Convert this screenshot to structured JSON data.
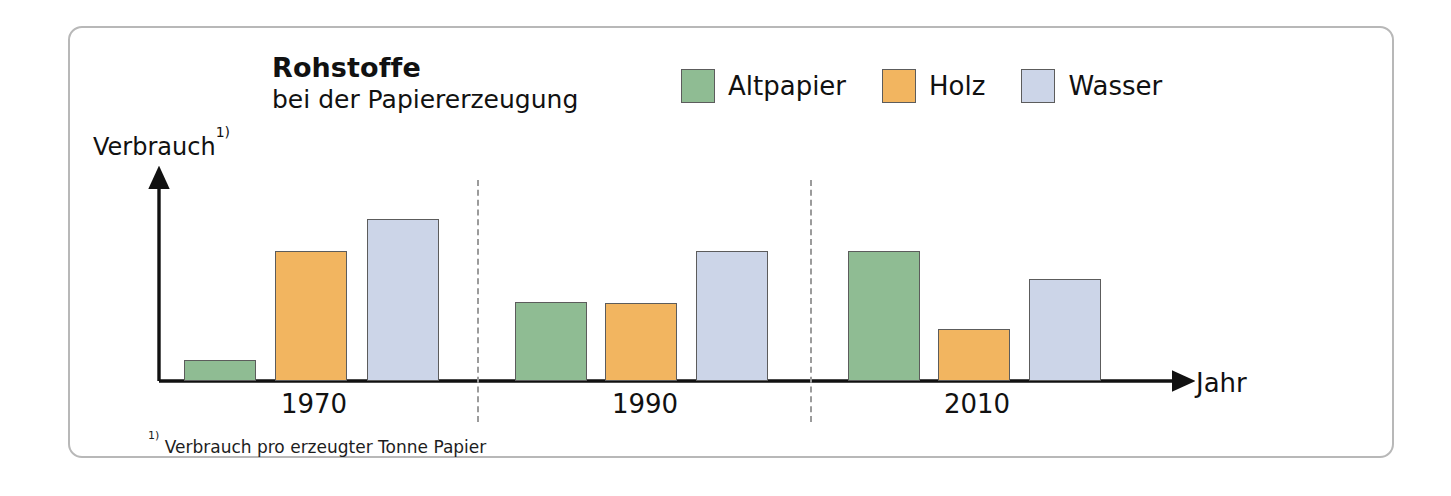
{
  "card": {
    "border_color": "#b8b8b8"
  },
  "header": {
    "title": "Rohstoffe",
    "subtitle": "bei der Papiererzeugung"
  },
  "legend": {
    "items": [
      {
        "label": "Altpapier",
        "color": "#8fbc93",
        "swatch_name": "legend-swatch-altpapier"
      },
      {
        "label": "Holz",
        "color": "#f2b560",
        "swatch_name": "legend-swatch-holz"
      },
      {
        "label": "Wasser",
        "color": "#ccd5e8",
        "swatch_name": "legend-swatch-wasser"
      }
    ]
  },
  "axes": {
    "y_title": "Verbrauch",
    "y_title_footnote_marker": "1)",
    "x_title": "Jahr"
  },
  "footnote": {
    "marker": "1)",
    "text": " Verbrauch pro erzeugter Tonne Papier"
  },
  "chart_data": {
    "type": "bar",
    "title": "Rohstoffe bei der Papiererzeugung",
    "subtitle": "bei der Papiererzeugung",
    "xlabel": "Jahr",
    "ylabel": "Verbrauch",
    "ylabel_note": "Verbrauch pro erzeugter Tonne Papier",
    "categories": [
      "1970",
      "1990",
      "2010"
    ],
    "grid": false,
    "legend_position": "top-right",
    "axis_style": "arrow-axes, no y tick labels (qualitative scale)",
    "ylim": [
      0,
      180
    ],
    "series": [
      {
        "name": "Altpapier",
        "color": "#8fbc93",
        "values": [
          21,
          79,
          130
        ]
      },
      {
        "name": "Holz",
        "color": "#f2b560",
        "values": [
          130,
          78,
          52
        ]
      },
      {
        "name": "Wasser",
        "color": "#ccd5e8",
        "values": [
          162,
          130,
          102
        ]
      }
    ],
    "group_dividers": [
      "between 1970 and 1990",
      "between 1990 and 2010"
    ]
  },
  "geometry": {
    "baseline_y": 381,
    "y_axis_x": 159,
    "y_axis_top": 176,
    "x_axis_end": 1185,
    "bar_width": 72,
    "dividers_x": [
      477,
      810
    ],
    "bars": [
      {
        "group": "1970",
        "series": "Altpapier",
        "x": 184,
        "top": 360
      },
      {
        "group": "1970",
        "series": "Holz",
        "x": 275,
        "top": 251
      },
      {
        "group": "1970",
        "series": "Wasser",
        "x": 367,
        "top": 219
      },
      {
        "group": "1990",
        "series": "Altpapier",
        "x": 515,
        "top": 302
      },
      {
        "group": "1990",
        "series": "Holz",
        "x": 605,
        "top": 303
      },
      {
        "group": "1990",
        "series": "Wasser",
        "x": 696,
        "top": 251
      },
      {
        "group": "2010",
        "series": "Altpapier",
        "x": 848,
        "top": 251
      },
      {
        "group": "2010",
        "series": "Holz",
        "x": 938,
        "top": 329
      },
      {
        "group": "2010",
        "series": "Wasser",
        "x": 1029,
        "top": 279
      }
    ],
    "year_label_x": [
      314,
      645,
      977
    ],
    "year_label_y": 389
  }
}
